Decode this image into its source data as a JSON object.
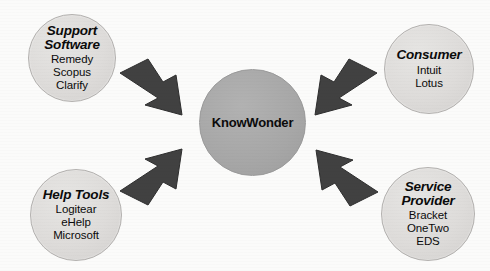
{
  "diagram": {
    "center": {
      "label": "KnowWonder"
    },
    "nodes": [
      {
        "id": "support-software",
        "title": "Support Software",
        "title_line1": "Support",
        "title_line2": "Software",
        "items": [
          "Remedy",
          "Scopus",
          "Clarify"
        ]
      },
      {
        "id": "consumer",
        "title": "Consumer",
        "title_line1": "Consumer",
        "title_line2": "",
        "items": [
          "Intuit",
          "Lotus"
        ]
      },
      {
        "id": "help-tools",
        "title": "Help Tools",
        "title_line1": "Help Tools",
        "title_line2": "",
        "items": [
          "Logitear",
          "eHelp",
          "Microsoft"
        ]
      },
      {
        "id": "service-provider",
        "title": "Service Provider",
        "title_line1": "Service",
        "title_line2": "Provider",
        "items": [
          "Bracket",
          "OneTwo",
          "EDS"
        ]
      }
    ],
    "arrows": [
      {
        "from": "support-software",
        "to": "center",
        "direction": "southeast"
      },
      {
        "from": "consumer",
        "to": "center",
        "direction": "southwest"
      },
      {
        "from": "help-tools",
        "to": "center",
        "direction": "northeast"
      },
      {
        "from": "service-provider",
        "to": "center",
        "direction": "northwest"
      }
    ],
    "colors": {
      "outer_circle_fill": "#dedcda",
      "outer_circle_border": "#b3b1af",
      "center_circle_fill": "#a7a7a7",
      "arrow_fill": "#414141",
      "text": "#0b0b0b",
      "background": "#fbfbfa"
    }
  }
}
